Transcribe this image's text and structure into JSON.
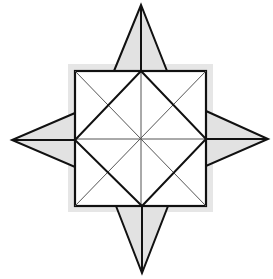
{
  "diagram": {
    "title": "",
    "colors": {
      "background": "#ffffff",
      "stroke": "#111111",
      "thin_stroke": "#555555",
      "point_fill": "#e2e2e2",
      "shadow": "#e6e6e6"
    },
    "center": [
      141,
      139
    ],
    "square": {
      "x1": 75,
      "y1": 71,
      "x2": 206,
      "y2": 206
    },
    "shadow_rect": {
      "x": 68,
      "y": 64,
      "w": 145,
      "h": 148
    },
    "points": {
      "top": [
        141,
        5
      ],
      "right": [
        268,
        139
      ],
      "bottom": [
        142,
        273
      ],
      "left": [
        12,
        140
      ]
    },
    "point_triangles": [
      {
        "name": "top",
        "tip": [
          141,
          5
        ],
        "base": [
          [
            114,
            71
          ],
          [
            167,
            71
          ]
        ]
      },
      {
        "name": "right",
        "tip": [
          268,
          139
        ],
        "base": [
          [
            206,
            111
          ],
          [
            206,
            166
          ]
        ]
      },
      {
        "name": "bottom",
        "tip": [
          142,
          273
        ],
        "base": [
          [
            116,
            206
          ],
          [
            168,
            206
          ]
        ]
      },
      {
        "name": "left",
        "tip": [
          12,
          140
        ],
        "base": [
          [
            75,
            113
          ],
          [
            75,
            167
          ]
        ]
      }
    ],
    "inner_diamond": [
      [
        141,
        71
      ],
      [
        206,
        139
      ],
      [
        142,
        206
      ],
      [
        75,
        140
      ]
    ]
  }
}
